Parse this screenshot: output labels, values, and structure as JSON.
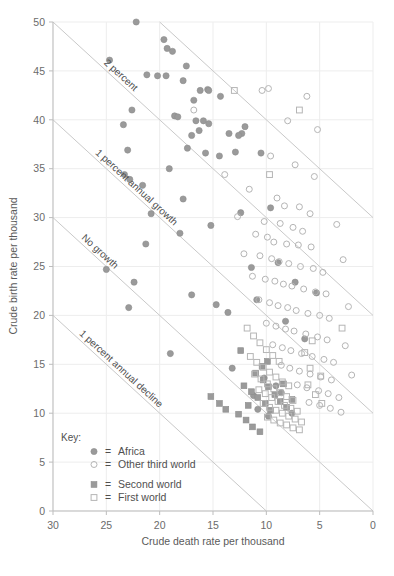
{
  "chart_data": {
    "type": "scatter",
    "title": "",
    "xlabel": "Crude death rate per thousand",
    "ylabel": "Crude birth rate per thousand",
    "xlim": [
      30,
      0
    ],
    "ylim": [
      0,
      50
    ],
    "x_reversed": true,
    "xticks": [
      30,
      25,
      20,
      15,
      10,
      5,
      0
    ],
    "yticks": [
      0,
      5,
      10,
      15,
      20,
      25,
      30,
      35,
      40,
      45,
      50
    ],
    "grid": true,
    "legend_position": "lower-left-inside",
    "legend_title": "Key:",
    "series": [
      {
        "name": "Africa",
        "marker": "filled-circle",
        "color": "#9a9a9a",
        "points": [
          [
            22.2,
            50.0
          ],
          [
            19.6,
            48.2
          ],
          [
            18.8,
            47.0
          ],
          [
            24.7,
            46.1
          ],
          [
            19.3,
            47.3
          ],
          [
            17.5,
            45.5
          ],
          [
            21.2,
            44.6
          ],
          [
            20.2,
            44.5
          ],
          [
            19.4,
            44.5
          ],
          [
            17.8,
            44.0
          ],
          [
            16.2,
            43.0
          ],
          [
            15.5,
            43.1
          ],
          [
            15.4,
            43.0
          ],
          [
            14.3,
            42.4
          ],
          [
            16.8,
            42.0
          ],
          [
            22.6,
            41.0
          ],
          [
            18.6,
            40.4
          ],
          [
            18.3,
            40.3
          ],
          [
            16.6,
            39.9
          ],
          [
            15.9,
            39.9
          ],
          [
            15.4,
            39.6
          ],
          [
            23.4,
            39.5
          ],
          [
            16.3,
            38.9
          ],
          [
            13.5,
            38.6
          ],
          [
            17.0,
            38.4
          ],
          [
            23.0,
            36.9
          ],
          [
            12.0,
            39.3
          ],
          [
            12.3,
            38.6
          ],
          [
            12.6,
            38.4
          ],
          [
            17.4,
            37.1
          ],
          [
            15.7,
            36.6
          ],
          [
            14.4,
            36.3
          ],
          [
            23.3,
            34.4
          ],
          [
            22.8,
            33.9
          ],
          [
            21.6,
            33.3
          ],
          [
            19.1,
            35.0
          ],
          [
            12.9,
            36.7
          ],
          [
            10.5,
            36.6
          ],
          [
            17.8,
            31.9
          ],
          [
            20.8,
            30.4
          ],
          [
            21.3,
            27.3
          ],
          [
            18.1,
            28.4
          ],
          [
            15.2,
            29.2
          ],
          [
            12.4,
            30.5
          ],
          [
            9.6,
            31.0
          ],
          [
            25.0,
            24.7
          ],
          [
            22.4,
            23.4
          ],
          [
            17.0,
            22.1
          ],
          [
            14.7,
            21.1
          ],
          [
            13.6,
            20.3
          ],
          [
            11.4,
            24.9
          ],
          [
            8.9,
            25.4
          ],
          [
            10.9,
            21.6
          ],
          [
            7.3,
            23.4
          ],
          [
            5.3,
            22.3
          ],
          [
            8.2,
            19.4
          ],
          [
            6.4,
            17.6
          ],
          [
            22.9,
            20.8
          ],
          [
            19.0,
            16.1
          ],
          [
            13.2,
            14.6
          ],
          [
            10.2,
            13.6
          ],
          [
            9.1,
            12.8
          ],
          [
            8.6,
            12.1
          ],
          [
            11.2,
            11.8
          ],
          [
            10.8,
            10.4
          ],
          [
            9.8,
            9.7
          ],
          [
            7.6,
            10.0
          ]
        ]
      },
      {
        "name": "Other third world",
        "marker": "open-circle",
        "color": "#b5b5b5",
        "points": [
          [
            16.8,
            41.0
          ],
          [
            9.8,
            43.2
          ],
          [
            10.4,
            43.0
          ],
          [
            6.2,
            42.4
          ],
          [
            8.0,
            39.9
          ],
          [
            5.2,
            39.0
          ],
          [
            9.6,
            36.3
          ],
          [
            13.9,
            34.4
          ],
          [
            7.3,
            35.4
          ],
          [
            5.5,
            34.2
          ],
          [
            11.6,
            32.9
          ],
          [
            9.0,
            32.0
          ],
          [
            8.3,
            31.2
          ],
          [
            6.9,
            31.1
          ],
          [
            5.9,
            30.4
          ],
          [
            12.7,
            30.1
          ],
          [
            10.2,
            29.6
          ],
          [
            8.7,
            29.4
          ],
          [
            7.5,
            29.0
          ],
          [
            6.6,
            28.6
          ],
          [
            11.0,
            28.3
          ],
          [
            9.9,
            28.0
          ],
          [
            9.3,
            27.5
          ],
          [
            8.1,
            27.3
          ],
          [
            7.0,
            27.2
          ],
          [
            5.8,
            27.0
          ],
          [
            12.1,
            26.3
          ],
          [
            10.6,
            26.1
          ],
          [
            9.5,
            25.8
          ],
          [
            8.8,
            25.5
          ],
          [
            7.9,
            25.3
          ],
          [
            6.8,
            25.0
          ],
          [
            5.6,
            24.8
          ],
          [
            4.7,
            24.4
          ],
          [
            11.3,
            24.0
          ],
          [
            10.1,
            23.7
          ],
          [
            9.2,
            23.5
          ],
          [
            8.4,
            23.2
          ],
          [
            7.6,
            23.0
          ],
          [
            6.5,
            22.7
          ],
          [
            5.4,
            22.4
          ],
          [
            4.4,
            22.2
          ],
          [
            10.7,
            21.6
          ],
          [
            9.7,
            21.3
          ],
          [
            8.9,
            21.0
          ],
          [
            8.0,
            20.8
          ],
          [
            7.2,
            20.5
          ],
          [
            6.1,
            20.2
          ],
          [
            5.0,
            20.0
          ],
          [
            4.1,
            19.7
          ],
          [
            10.0,
            19.2
          ],
          [
            9.1,
            18.9
          ],
          [
            8.2,
            18.6
          ],
          [
            7.4,
            18.4
          ],
          [
            6.3,
            18.1
          ],
          [
            5.2,
            17.8
          ],
          [
            4.3,
            17.5
          ],
          [
            9.4,
            17.0
          ],
          [
            8.5,
            16.7
          ],
          [
            7.7,
            16.4
          ],
          [
            6.7,
            16.1
          ],
          [
            5.7,
            15.8
          ],
          [
            4.6,
            15.5
          ],
          [
            3.7,
            15.2
          ],
          [
            8.6,
            14.9
          ],
          [
            7.8,
            14.6
          ],
          [
            6.9,
            14.3
          ],
          [
            5.9,
            14.0
          ],
          [
            4.9,
            13.7
          ],
          [
            3.9,
            13.4
          ],
          [
            7.1,
            12.9
          ],
          [
            6.2,
            12.6
          ],
          [
            5.1,
            12.3
          ],
          [
            4.2,
            12.0
          ],
          [
            3.2,
            11.6
          ],
          [
            6.0,
            11.1
          ],
          [
            5.0,
            10.8
          ],
          [
            4.0,
            10.5
          ],
          [
            3.0,
            10.1
          ],
          [
            2.3,
            20.9
          ],
          [
            2.8,
            25.7
          ],
          [
            3.4,
            29.3
          ],
          [
            2.6,
            16.9
          ],
          [
            2.0,
            13.9
          ]
        ]
      },
      {
        "name": "Second world",
        "marker": "filled-square",
        "color": "#9a9a9a",
        "points": [
          [
            15.2,
            11.7
          ],
          [
            14.4,
            11.0
          ],
          [
            13.8,
            10.4
          ],
          [
            12.6,
            9.9
          ],
          [
            11.9,
            9.3
          ],
          [
            11.3,
            8.6
          ],
          [
            10.6,
            8.1
          ],
          [
            12.1,
            12.8
          ],
          [
            11.4,
            12.2
          ],
          [
            10.8,
            11.6
          ],
          [
            10.1,
            11.0
          ],
          [
            9.6,
            10.3
          ],
          [
            10.3,
            13.4
          ],
          [
            9.8,
            12.7
          ],
          [
            9.2,
            11.9
          ],
          [
            8.7,
            11.2
          ],
          [
            11.0,
            14.1
          ],
          [
            10.4,
            14.8
          ],
          [
            9.9,
            15.3
          ],
          [
            8.1,
            10.6
          ],
          [
            12.4,
            16.4
          ],
          [
            8.4,
            13.0
          ],
          [
            11.7,
            10.8
          ],
          [
            7.6,
            11.4
          ]
        ]
      },
      {
        "name": "First world",
        "marker": "open-square",
        "color": "#b5b5b5",
        "points": [
          [
            13.0,
            43.0
          ],
          [
            6.9,
            41.0
          ],
          [
            9.7,
            34.4
          ],
          [
            11.8,
            18.7
          ],
          [
            11.2,
            17.9
          ],
          [
            10.6,
            17.2
          ],
          [
            10.0,
            16.5
          ],
          [
            9.4,
            15.9
          ],
          [
            8.8,
            15.3
          ],
          [
            11.5,
            15.8
          ],
          [
            10.9,
            15.2
          ],
          [
            10.3,
            14.7
          ],
          [
            9.7,
            14.2
          ],
          [
            9.1,
            13.7
          ],
          [
            8.5,
            13.2
          ],
          [
            7.9,
            12.8
          ],
          [
            11.1,
            14.0
          ],
          [
            10.5,
            13.5
          ],
          [
            9.9,
            13.0
          ],
          [
            9.3,
            12.5
          ],
          [
            8.7,
            12.1
          ],
          [
            8.1,
            11.7
          ],
          [
            7.5,
            11.3
          ],
          [
            10.7,
            12.4
          ],
          [
            10.1,
            12.0
          ],
          [
            9.5,
            11.6
          ],
          [
            8.9,
            11.2
          ],
          [
            8.3,
            10.8
          ],
          [
            7.7,
            10.5
          ],
          [
            7.1,
            10.2
          ],
          [
            10.3,
            11.0
          ],
          [
            9.7,
            10.6
          ],
          [
            9.1,
            10.3
          ],
          [
            8.5,
            10.0
          ],
          [
            7.9,
            9.7
          ],
          [
            7.3,
            9.4
          ],
          [
            6.7,
            9.1
          ],
          [
            9.9,
            9.6
          ],
          [
            9.3,
            9.3
          ],
          [
            8.7,
            9.0
          ],
          [
            8.1,
            8.8
          ],
          [
            7.5,
            8.5
          ],
          [
            6.9,
            8.3
          ],
          [
            6.1,
            12.9
          ],
          [
            5.4,
            11.9
          ],
          [
            4.8,
            11.0
          ],
          [
            5.9,
            14.6
          ],
          [
            4.9,
            13.8
          ],
          [
            6.4,
            16.2
          ],
          [
            5.7,
            17.4
          ],
          [
            2.9,
            18.7
          ]
        ]
      }
    ],
    "reference_lines": [
      {
        "label": "3 percent",
        "growth": 3
      },
      {
        "label": "2 percent",
        "growth": 2
      },
      {
        "label": "1 percent annual growth",
        "growth": 1
      },
      {
        "label": "No growth",
        "growth": 0
      },
      {
        "label": "1 percent annual decline",
        "growth": -1
      }
    ]
  },
  "axes": {
    "x_title": "Crude death rate per thousand",
    "y_title": "Crude birth rate per thousand",
    "x_ticks": [
      "30",
      "25",
      "20",
      "15",
      "10",
      "5",
      "0"
    ],
    "y_ticks": [
      "0",
      "5",
      "10",
      "15",
      "20",
      "25",
      "30",
      "35",
      "40",
      "45",
      "50"
    ]
  },
  "legend": {
    "title": "Key:",
    "entries": [
      {
        "marker": "filled-circle",
        "eq": "=",
        "label": "Africa"
      },
      {
        "marker": "open-circle",
        "eq": "=",
        "label": "Other third world"
      },
      {
        "marker": "filled-square",
        "eq": "=",
        "label": "Second world"
      },
      {
        "marker": "open-square",
        "eq": "=",
        "label": "First world"
      }
    ]
  },
  "line_labels": {
    "l3": "3 percent",
    "l2": "2 percent",
    "l1": "1 percent annual growth",
    "l0": "No growth",
    "lm1": "1 percent annual decline"
  },
  "colors": {
    "fill_marker": "#9a9a9a",
    "open_marker": "#b5b5b5",
    "grid": "#ededed",
    "axis": "#bdbdbd",
    "refline": "#c9c9c9",
    "text": "#5a5a5a"
  }
}
